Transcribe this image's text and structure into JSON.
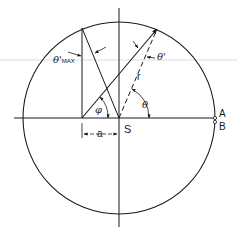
{
  "diagram": {
    "type": "geometry-circle",
    "labels": {
      "theta_max": "θ'",
      "theta_max_sub": "MAX",
      "theta_prime": "θ'",
      "r": "r",
      "phi": "φ",
      "theta": "θ",
      "a": "a",
      "S": "S",
      "A": "A",
      "B": "B"
    },
    "colors": {
      "line": "#1a1a1a",
      "background": "#ffffff"
    }
  }
}
